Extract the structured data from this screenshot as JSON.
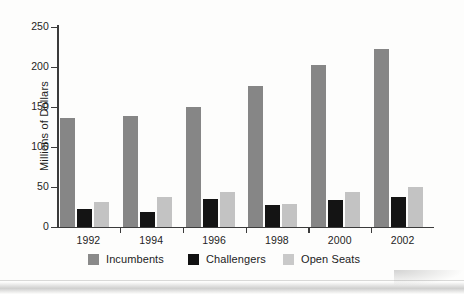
{
  "chart_data": {
    "type": "bar",
    "title": "",
    "subtitle": "",
    "xlabel": "",
    "ylabel": "Millions of Dollars",
    "categories": [
      "1992",
      "1994",
      "1996",
      "1998",
      "2000",
      "2002"
    ],
    "series": [
      {
        "name": "Incumbents",
        "color": "#868686",
        "values": [
          136,
          139,
          150,
          176,
          202,
          222
        ]
      },
      {
        "name": "Challengers",
        "color": "#141414",
        "values": [
          22,
          19,
          35,
          27,
          34,
          38
        ]
      },
      {
        "name": "Open Seats",
        "color": "#c3c3c3",
        "values": [
          31,
          37,
          44,
          29,
          44,
          50
        ]
      }
    ],
    "ylim": [
      0,
      250
    ],
    "yticks": [
      0,
      50,
      100,
      150,
      200,
      250
    ],
    "ytick_labels": [
      "0",
      "50",
      "100",
      "150",
      "200",
      "250"
    ],
    "grid": false,
    "legend_position": "bottom"
  },
  "legend": {
    "items": [
      {
        "label": "Incumbents",
        "swatch": "incumbents-swatch"
      },
      {
        "label": "Challengers",
        "swatch": "challengers-swatch"
      },
      {
        "label": "Open Seats",
        "swatch": "open-seats-swatch"
      }
    ]
  },
  "axis": {
    "y_title": "Millions of Dollars"
  }
}
